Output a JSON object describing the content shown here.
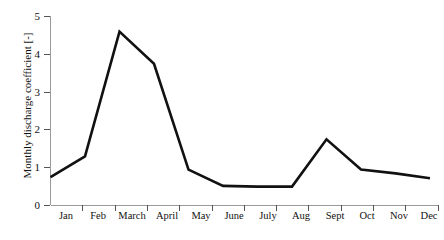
{
  "chart_data": {
    "type": "line",
    "title": "",
    "xlabel": "",
    "ylabel": "Monthly discharge coefficient [-]",
    "categories": [
      "Jan",
      "Feb",
      "March",
      "April",
      "May",
      "June",
      "July",
      "Aug",
      "Sept",
      "Oct",
      "Nov",
      "Dec"
    ],
    "values": [
      0.75,
      1.3,
      4.6,
      3.75,
      0.95,
      0.52,
      0.5,
      0.5,
      1.75,
      0.95,
      0.85,
      0.72
    ],
    "series": [
      {
        "name": "Monthly discharge coefficient",
        "values": [
          0.75,
          1.3,
          4.6,
          3.75,
          0.95,
          0.52,
          0.5,
          0.5,
          1.75,
          0.95,
          0.85,
          0.72
        ]
      }
    ],
    "ylim": [
      0,
      5
    ],
    "yticks": [
      0,
      1,
      2,
      3,
      4,
      5
    ],
    "ytick_labels": [
      "0",
      "1",
      "2",
      "3",
      "4",
      "5"
    ],
    "grid": false,
    "legend": false,
    "line_color": "#111111",
    "axis_color": "#9a9a9a"
  },
  "axes": {
    "y_title": "Monthly discharge coefficient [-]",
    "y_tick_labels": [
      "5",
      "4",
      "3",
      "2",
      "1",
      "0"
    ],
    "x_tick_labels": [
      "Jan",
      "Feb",
      "March",
      "April",
      "May",
      "June",
      "July",
      "Aug",
      "Sept",
      "Oct",
      "Nov",
      "Dec"
    ]
  }
}
